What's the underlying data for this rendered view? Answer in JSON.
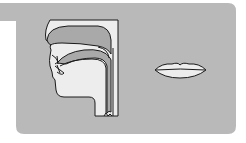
{
  "figure": {
    "type": "articulation diagram",
    "panels": [
      {
        "id": "sagittal-section",
        "description": "Sagittal (side) section of the vocal tract: nasal cavity, palate, oral cavity, tongue, lips, pharynx"
      },
      {
        "id": "lip-shape",
        "description": "Front view of the lips, spread/neutral, slightly apart"
      }
    ]
  },
  "colors": {
    "background": "#ffffff",
    "panel": "#b9b9b9",
    "cavity": "#a9a9a9",
    "tissue": "#ededed",
    "outline": "#1a1a1a"
  }
}
